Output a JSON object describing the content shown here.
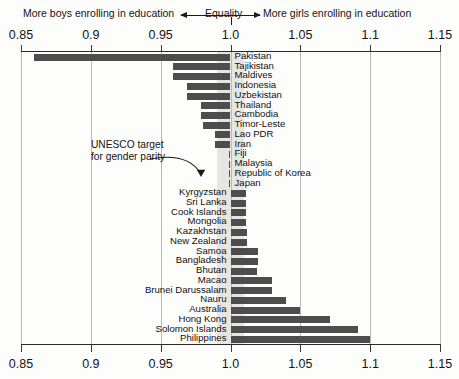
{
  "header": {
    "left_note": "More boys enrolling in education",
    "equality_note": "Equality",
    "right_note": "More girls enrolling in education",
    "arrow_left_icon": "arrow-left-icon",
    "arrow_right_icon": "arrow-right-icon"
  },
  "annotation": {
    "line1": "UNESCO target",
    "line2": "for gender parity",
    "pointer_icon": "curved-arrow-icon"
  },
  "chart_data": {
    "type": "bar",
    "orientation": "horizontal",
    "title": "",
    "subtitle": "",
    "xlabel": "",
    "ylabel": "",
    "xlim": [
      0.85,
      1.15
    ],
    "baseline": 1.0,
    "grid": true,
    "gridlines": [
      0.85,
      0.9,
      0.95,
      1.0,
      1.05,
      1.1,
      1.15
    ],
    "tick_labels": [
      "0.85",
      "0.9",
      "0.95",
      "1.0",
      "1.05",
      "1.1",
      "1.15"
    ],
    "legend": [],
    "bar_color": "#4d4d4d",
    "band_color": "#e6e5e2",
    "parity_band": [
      0.99,
      1.01
    ],
    "annotations": [
      "More boys enrolling in education",
      "Equality",
      "More girls enrolling in education",
      "UNESCO target for gender parity"
    ],
    "categories": [
      "Pakistan",
      "Tajikistan",
      "Maldives",
      "Indonesia",
      "Uzbekistan",
      "Thailand",
      "Cambodia",
      "Timor-Leste",
      "Lao PDR",
      "Iran",
      "Fiji",
      "Malaysia",
      "Republic of Korea",
      "Japan",
      "Kyrgyzstan",
      "Sri Lanka",
      "Cook Islands",
      "Mongolia",
      "Kazakhstan",
      "New Zealand",
      "Samoa",
      "Bangladesh",
      "Bhutan",
      "Macao",
      "Brunei Darussalam",
      "Nauru",
      "Australia",
      "Hong Kong",
      "Solomon Islands",
      "Philippines"
    ],
    "values": [
      0.859,
      0.959,
      0.959,
      0.969,
      0.969,
      0.979,
      0.979,
      0.98,
      0.989,
      0.989,
      0.999,
      0.999,
      0.999,
      0.999,
      1.011,
      1.011,
      1.011,
      1.011,
      1.012,
      1.012,
      1.02,
      1.02,
      1.019,
      1.03,
      1.03,
      1.04,
      1.05,
      1.071,
      1.091,
      1.1
    ],
    "label_side": [
      "right",
      "right",
      "right",
      "right",
      "right",
      "right",
      "right",
      "right",
      "right",
      "right",
      "right",
      "right",
      "right",
      "right",
      "left",
      "left",
      "left",
      "left",
      "left",
      "left",
      "left",
      "left",
      "left",
      "left",
      "left",
      "left",
      "left",
      "left",
      "left",
      "left"
    ]
  }
}
